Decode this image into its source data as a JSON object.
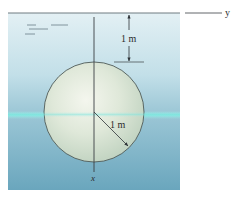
{
  "figure": {
    "axes": {
      "y_label": "y",
      "x_label": "x"
    },
    "dimensions": {
      "depth_to_top_label": "1 m",
      "radius_label": "1 m"
    },
    "colors": {
      "water_top": "#dcecf2",
      "water_mid": "#a9cfdc",
      "water_bottom": "#6fa9c0",
      "highlight_band": "#7fe6e0",
      "disk_light": "#f1f4ec",
      "disk_mid": "#cfdcc9",
      "line": "#3a3f44"
    }
  }
}
